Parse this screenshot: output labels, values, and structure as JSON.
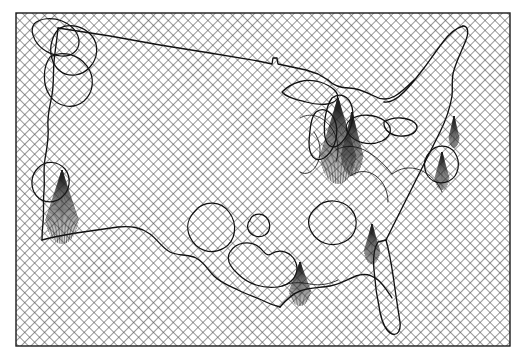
{
  "figure": {
    "domain": "map",
    "title": "",
    "caption": "",
    "background_color": "#ffffff",
    "ink_color": "#000000",
    "hatch_color": "#555555",
    "frame": {
      "name": "map-frame",
      "x": 16,
      "y": 13,
      "width": 494,
      "height": 333,
      "stroke": "#1a1a1a",
      "stroke_width": 1.4,
      "fill": "none"
    },
    "fill_pattern": {
      "name": "diagonal-crosshatch",
      "type": "crosshatch",
      "angle_degrees": 45,
      "spacing_px": 7,
      "line_width": 1.1,
      "color": "#4d4d4d"
    },
    "fan_pattern": {
      "name": "radial-fan-hatch",
      "type": "radial-lines",
      "color": "#1a1a1a",
      "line_width": 0.6,
      "description": "thin fan of lines converging to an apex inside certain polygons"
    },
    "outline_style": {
      "stroke": "#111111",
      "stroke_width": 1.2,
      "fill": "none"
    }
  },
  "layers": [
    {
      "id": "basemap-hatch",
      "label": "Background crosshatch fill",
      "visible": true
    },
    {
      "id": "national-border",
      "label": "National boundary outline",
      "visible": true
    },
    {
      "id": "coastline",
      "label": "Coastline",
      "visible": true
    },
    {
      "id": "great-lakes",
      "label": "Great Lakes",
      "visible": true
    },
    {
      "id": "region-polygons",
      "label": "Highlighted region polygons",
      "visible": true
    },
    {
      "id": "fan-regions",
      "label": "Fan-hatched regions",
      "visible": true
    },
    {
      "id": "map-frame",
      "label": "Map neat line / frame",
      "visible": true
    }
  ],
  "geometry": {
    "conus_outline": "M 42,236 L 40,208 L 41,186 L 38,166 L 40,148 L 45,131 L 48,112 L 52,94 L 54,76 L 56,58 L 58,40 L 59,26 L 66,23 L 74,27 L 82,24 L 90,29 L 99,33 L 112,36 L 128,40 L 145,43 L 163,46 L 181,49 L 200,52 L 219,55 L 237,58 L 253,61 L 268,64 L 276,66 L 281,60 L 288,57 L 296,60 L 302,66 L 310,70 L 318,72 L 326,76 L 330,84 L 336,88 L 344,86 L 352,88 L 360,92 L 368,96 L 376,98 L 384,96 L 392,92 L 400,84 L 408,76 L 416,66 L 424,56 L 432,46 L 440,36 L 448,30 L 456,26 L 464,30 L 470,40 L 466,52 L 460,62 L 454,72 L 450,84 L 452,96 L 456,106 L 452,118 L 444,128 L 438,140 L 434,152 L 430,164 L 426,176 L 420,188 L 414,200 L 408,212 L 404,226 L 400,240 L 396,254 L 392,268 L 390,282 L 388,296 L 384,310 L 378,318 L 370,314 L 364,304 L 358,292 L 352,282 L 346,276 L 338,278 L 330,284 L 322,290 L 314,294 L 306,298 L 298,300 L 290,302 L 282,306 L 274,310 L 266,304 L 260,294 L 256,284 L 250,276 L 242,272 L 232,270 L 222,268 L 210,266 L 198,264 L 186,262 L 174,260 L 162,258 L 150,256 L 138,254 L 126,252 L 114,250 L 102,248 L 90,246 L 78,244 L 66,242 L 54,240 Z",
    "northern_border": "M 59,26 L 120,38 L 180,48 L 240,57 L 272,63 L 276,57 L 279,63 L 300,67 L 330,79",
    "west_coast": "M 42,236 L 44,222 L 46,208 L 44,194 L 42,180 L 45,166 L 48,152 L 46,138 L 49,124 L 52,110 L 55,96 L 53,82 L 56,68 L 58,54 L 57,40 L 59,26",
    "great_lakes": [
      "M 286,88 L 296,82 L 308,80 L 320,84 L 330,90 L 336,96 L 330,102 L 318,104 L 306,100 L 294,96 Z",
      "M 332,96 L 340,92 L 348,96 L 352,106 L 350,118 L 344,128 L 336,136 L 330,130 L 328,118 L 330,106 Z",
      "M 318,112 L 326,108 L 334,114 L 336,126 L 332,140 L 326,152 L 318,156 L 312,148 L 312,134 L 314,122 Z",
      "M 352,118 L 362,114 L 374,116 L 384,122 L 388,132 L 382,140 L 370,142 L 358,138 L 350,130 Z",
      "M 386,122 L 398,118 L 410,120 L 416,126 L 412,132 L 400,134 L 390,130 Z"
    ],
    "region_polygons": [
      {
        "name": "pacific-northwest-region-a",
        "d": "M 34,24 L 46,20 L 60,22 L 72,28 L 78,38 L 74,48 L 64,54 L 52,52 L 42,46 L 34,36 Z"
      },
      {
        "name": "pacific-northwest-region-b",
        "d": "M 58,30 L 72,26 L 86,30 L 94,40 L 92,54 L 84,64 L 72,68 L 60,62 L 54,50 L 54,38 Z"
      },
      {
        "name": "cascadia-region",
        "d": "M 52,56 L 66,52 L 80,58 L 88,70 L 88,84 L 80,94 L 68,98 L 56,92 L 50,80 L 48,66 Z"
      },
      {
        "name": "california-coast-region",
        "d": "M 40,166 L 52,162 L 62,168 L 66,180 L 62,192 L 52,198 L 42,194 L 36,182 Z"
      },
      {
        "name": "great-basin-blob",
        "d": "M 196,208 L 212,204 L 226,212 L 230,228 L 222,242 L 206,246 L 194,238 L 190,222 Z"
      },
      {
        "name": "small-circular-blob",
        "d": "M 252,216 L 262,214 L 270,222 L 268,232 L 258,236 L 250,230 L 248,222 Z"
      },
      {
        "name": "gulf-interior-blob",
        "d": "M 232,250 L 246,244 L 258,248 L 266,258 L 278,254 L 290,258 L 294,270 L 286,280 L 272,284 L 258,282 L 244,276 L 234,266 Z"
      },
      {
        "name": "appalachian-blob",
        "d": "M 318,206 L 334,200 L 348,206 L 354,218 L 350,232 L 338,240 L 324,238 L 314,228 L 312,216 Z"
      },
      {
        "name": "northeast-region",
        "d": "M 436,150 L 448,146 L 456,154 L 456,168 L 448,178 L 436,180 L 428,172 L 428,158 Z"
      }
    ],
    "fan_regions": [
      {
        "name": "fan-california",
        "apex_x": 62,
        "apex_y": 170,
        "rays": 26,
        "spread_deg": 36,
        "length": 74
      },
      {
        "name": "fan-ohio-valley",
        "apex_x": 338,
        "apex_y": 98,
        "rays": 30,
        "spread_deg": 34,
        "length": 86
      },
      {
        "name": "fan-lower-midwest",
        "apex_x": 352,
        "apex_y": 112,
        "rays": 22,
        "spread_deg": 28,
        "length": 64
      },
      {
        "name": "fan-gulf-louisiana",
        "apex_x": 300,
        "apex_y": 262,
        "rays": 20,
        "spread_deg": 40,
        "length": 44
      },
      {
        "name": "fan-southeast",
        "apex_x": 372,
        "apex_y": 224,
        "rays": 18,
        "spread_deg": 32,
        "length": 40
      },
      {
        "name": "fan-mid-atlantic",
        "apex_x": 442,
        "apex_y": 152,
        "rays": 16,
        "spread_deg": 30,
        "length": 38
      },
      {
        "name": "fan-new-england",
        "apex_x": 454,
        "apex_y": 116,
        "rays": 14,
        "spread_deg": 26,
        "length": 32
      }
    ]
  },
  "annotations": {
    "visible_labels": [],
    "legend": null,
    "scale_bar": null,
    "north_arrow": null,
    "axis_ticks": []
  }
}
